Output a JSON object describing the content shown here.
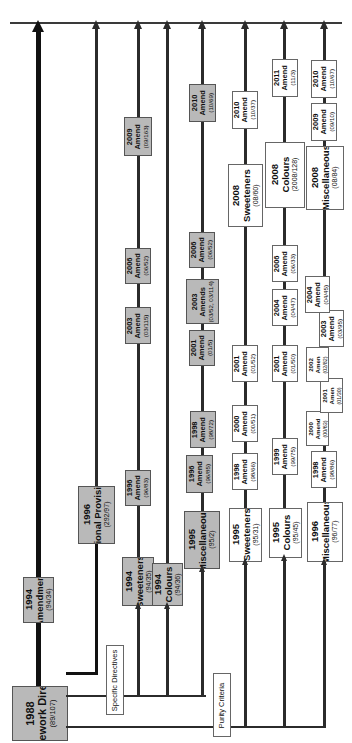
{
  "figure": {
    "orientation": "rotated-90-ccw",
    "colors": {
      "grey_fill": "#b9b9b9",
      "white_fill": "#ffffff",
      "line": "#2b2b2b",
      "line_thick": "#111111",
      "border": "#5a5a5a",
      "page_background": "#ffffff"
    }
  },
  "group_labels": {
    "specific_directives": "Specific Directives",
    "purity_criteria": "Purity Criteria"
  },
  "tracks": [
    {
      "id": "framework",
      "name": "Framework Directive track",
      "style": "thick",
      "root": {
        "year": "1988",
        "name": "Framework Directive",
        "ref": "(89/107)",
        "fill": "grey",
        "size": "t-xl"
      },
      "nodes": [
        {
          "year": "1994",
          "name": "Amendment",
          "ref": "(94/34)",
          "fill": "grey",
          "size": "t-lg"
        }
      ]
    },
    {
      "id": "national-provisions",
      "name": "National Provisions track",
      "style": "normal",
      "root": {
        "year": "1996",
        "name": "National Provisions",
        "ref": "(292/97)",
        "fill": "grey",
        "size": "t-lg"
      },
      "nodes": []
    },
    {
      "id": "sweeteners-1994",
      "name": "1994 Sweeteners track",
      "style": "normal",
      "root": {
        "year": "1994",
        "name": "Sweeteners",
        "ref": "(94/35)",
        "fill": "grey",
        "size": "t-lg"
      },
      "nodes": [
        {
          "year": "1996",
          "name": "Amend",
          "ref": "(96/83)",
          "fill": "grey",
          "size": "t-md"
        },
        {
          "year": "2003",
          "name": "Amend",
          "ref": "(03/115)",
          "fill": "grey",
          "size": "t-md"
        },
        {
          "year": "2006",
          "name": "Amend",
          "ref": "(06/52)",
          "fill": "grey",
          "size": "t-md"
        },
        {
          "year": "2009",
          "name": "Amend",
          "ref": "(09/163)",
          "fill": "grey",
          "size": "t-md"
        }
      ]
    },
    {
      "id": "colours-1994",
      "name": "1994 Colours track",
      "style": "normal",
      "root": {
        "year": "1994",
        "name": "Colours",
        "ref": "(94/36)",
        "fill": "grey",
        "size": "t-lg"
      },
      "nodes": []
    },
    {
      "id": "miscellaneous-1995",
      "name": "1995 'Miscellaneous' track",
      "style": "normal",
      "root": {
        "year": "1995",
        "name": "'Miscellaneous'",
        "ref": "(95/2)",
        "fill": "grey",
        "size": "t-lg"
      },
      "nodes": [
        {
          "year": "1996",
          "name": "Amend",
          "ref": "(96/85)",
          "fill": "grey",
          "size": "t-md"
        },
        {
          "year": "1998",
          "name": "Amend",
          "ref": "(98/72)",
          "fill": "grey",
          "size": "t-md"
        },
        {
          "year": "2001",
          "name": "Amend",
          "ref": "(01/5)",
          "fill": "grey",
          "size": "t-md"
        },
        {
          "year": "2003",
          "name": "Amends",
          "ref": "(03/52, 03/114)",
          "fill": "grey",
          "size": "t-md"
        },
        {
          "year": "2006",
          "name": "Amend",
          "ref": "(06/52)",
          "fill": "grey",
          "size": "t-md"
        },
        {
          "year": "2010",
          "name": "Amend",
          "ref": "(10/69)",
          "fill": "grey",
          "size": "t-md"
        }
      ]
    },
    {
      "id": "sweeteners-1995",
      "name": "1995 Sweeteners track",
      "style": "normal",
      "root": {
        "year": "1995",
        "name": "Sweeteners",
        "ref": "(95/31)",
        "fill": "white",
        "size": "t-lg"
      },
      "nodes": [
        {
          "year": "1998",
          "name": "Amend",
          "ref": "(98/66)",
          "fill": "white",
          "size": "t-md"
        },
        {
          "year": "2000",
          "name": "Amend",
          "ref": "(00/51)",
          "fill": "white",
          "size": "t-md"
        },
        {
          "year": "2001",
          "name": "Amend",
          "ref": "(01/52)",
          "fill": "white",
          "size": "t-md"
        },
        {
          "year": "2008",
          "name": "Sweeteners",
          "ref": "(08/60)",
          "fill": "white",
          "size": "t-lg"
        },
        {
          "year": "2010",
          "name": "Amend",
          "ref": "(10/37)",
          "fill": "white",
          "size": "t-md"
        }
      ]
    },
    {
      "id": "colours-1995",
      "name": "1995 Colours track",
      "style": "normal",
      "root": {
        "year": "1995",
        "name": "Colours",
        "ref": "(95/45)",
        "fill": "white",
        "size": "t-lg"
      },
      "nodes": [
        {
          "year": "1999",
          "name": "Amend",
          "ref": "(99/75)",
          "fill": "white",
          "size": "t-md"
        },
        {
          "year": "2001",
          "name": "Amend",
          "ref": "(01/50)",
          "fill": "white",
          "size": "t-md"
        },
        {
          "year": "2004",
          "name": "Amend",
          "ref": "(04/47)",
          "fill": "white",
          "size": "t-md"
        },
        {
          "year": "2006",
          "name": "Amend",
          "ref": "(06/33)",
          "fill": "white",
          "size": "t-md"
        },
        {
          "year": "2008",
          "name": "Colours",
          "ref": "(2008/128)",
          "fill": "white",
          "size": "t-lg"
        },
        {
          "year": "2011",
          "name": "Amend",
          "ref": "(11/3)",
          "fill": "white",
          "size": "t-md"
        }
      ]
    },
    {
      "id": "miscellaneous-1996",
      "name": "1996 'Miscellaneous' track",
      "style": "normal",
      "root": {
        "year": "1996",
        "name": "'Miscellaneous'",
        "ref": "(96/77)",
        "fill": "white",
        "size": "t-lg"
      },
      "nodes": [
        {
          "year": "1998",
          "name": "Amend",
          "ref": "(98/86)",
          "fill": "white",
          "size": "t-md"
        },
        {
          "year": "2000",
          "name": "Amend",
          "ref": "(00/63)",
          "fill": "white",
          "size": "t-sm"
        },
        {
          "year": "2001",
          "name": "Amen",
          "ref": "(01/30)",
          "fill": "white",
          "size": "t-sm"
        },
        {
          "year": "2002",
          "name": "Amen",
          "ref": "(02/82)",
          "fill": "white",
          "size": "t-sm"
        },
        {
          "year": "2003",
          "name": "Amend",
          "ref": "(03/95)",
          "fill": "white",
          "size": "t-md"
        },
        {
          "year": "2004",
          "name": "Amend",
          "ref": "(04/45)",
          "fill": "white",
          "size": "t-md"
        },
        {
          "year": "2008",
          "name": "'Miscellaneous'",
          "ref": "(08/84)",
          "fill": "white",
          "size": "t-lg"
        },
        {
          "year": "2009",
          "name": "Amend",
          "ref": "(09/10)",
          "fill": "white",
          "size": "t-md"
        },
        {
          "year": "2010",
          "name": "Amend",
          "ref": "(10/67)",
          "fill": "white",
          "size": "t-md"
        }
      ]
    }
  ]
}
